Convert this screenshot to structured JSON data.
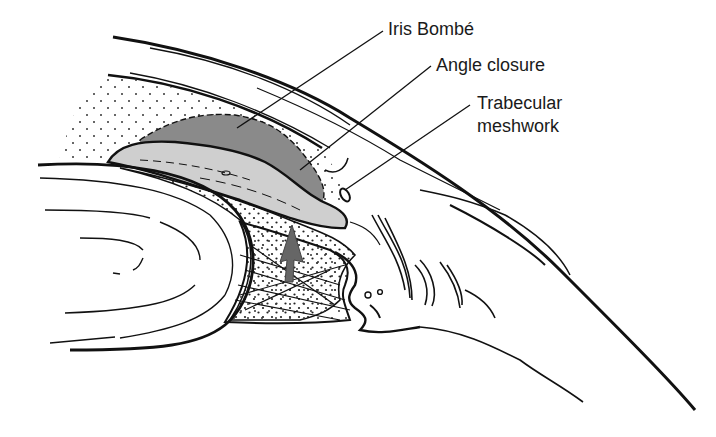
{
  "figure": {
    "labels": [
      {
        "id": "iris-bombe",
        "text": "Iris Bombé"
      },
      {
        "id": "angle-closure",
        "text": "Angle closure"
      },
      {
        "id": "trabecular-meshwork",
        "line1": "Trabecular",
        "line2": "meshwork"
      }
    ],
    "colors": {
      "ink": "#111111",
      "iris_dark_fill": "#8a8a8a",
      "iris_light_fill": "#cfcfcf",
      "arrow_fill": "#666666",
      "background": "#ffffff"
    }
  }
}
